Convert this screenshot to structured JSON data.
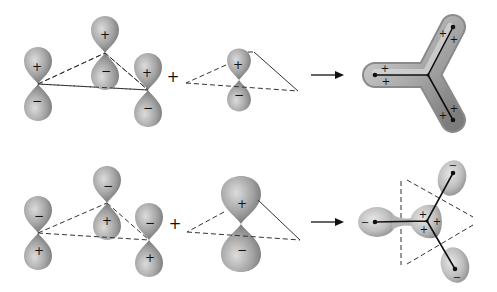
{
  "diagram": {
    "colors": {
      "lobe": "#8e8e8e",
      "lobe_highlight": "#d2d2d2",
      "lines": "#222222",
      "background": "#ffffff"
    },
    "rows": [
      {
        "id": "top",
        "orbitals_left": [
          {
            "upper": "+",
            "lower": "−"
          },
          {
            "upper": "+",
            "lower": "−"
          },
          {
            "upper": "+",
            "lower": "−"
          }
        ],
        "operator": "+",
        "orbital_center": {
          "upper": "+",
          "lower": "−"
        },
        "arrow": "→",
        "product": {
          "shape": "Y-shaped continuous lobe",
          "signs": [
            "+",
            "+",
            "+",
            "+",
            "+",
            "+"
          ]
        }
      },
      {
        "id": "bottom",
        "orbitals_left": [
          {
            "upper": "−",
            "lower": "+"
          },
          {
            "upper": "−",
            "lower": "+"
          },
          {
            "upper": "−",
            "lower": "+"
          }
        ],
        "operator": "+",
        "orbital_center": {
          "upper": "+",
          "lower": "−"
        },
        "arrow": "→",
        "product": {
          "shape": "trigonal three-lobed with central + region",
          "outer_signs": [
            "−",
            "−",
            "−"
          ],
          "center_signs": [
            "+",
            "+",
            "+"
          ]
        }
      }
    ]
  }
}
